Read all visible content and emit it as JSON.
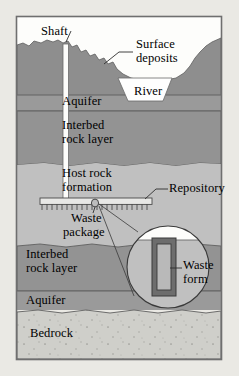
{
  "figure": {
    "frame": {
      "x": 16,
      "y": 16,
      "width": 206,
      "height": 344
    }
  },
  "palette": {
    "page_background": "#eae9e4",
    "sky": "#fdfdfb",
    "surface_deposits": "#8e8e8e",
    "aquifer": "#9a9a9a",
    "interbed_rock": "#939393",
    "host_rock": "#c0c0c0",
    "bedrock": "#cfcfca",
    "river_water": "#fefefe",
    "waste_package": "#6d6d6d",
    "waste_form": "#b9b9b9",
    "frame_stroke": "#6f6f6f",
    "line": "#3a3a3a",
    "text": "#000000"
  },
  "labels": {
    "shaft": "Shaft",
    "surface_deposits_line1": "Surface",
    "surface_deposits_line2": "deposits",
    "river": "River",
    "aquifer_upper": "Aquifer",
    "interbed_upper_line1": "Interbed",
    "interbed_upper_line2": "rock layer",
    "host_rock_line1": "Host rock",
    "host_rock_line2": "formation",
    "repository": "Repository",
    "waste_package_line1": "Waste",
    "waste_package_line2": "package",
    "interbed_lower_line1": "Interbed",
    "interbed_lower_line2": "rock layer",
    "waste_form_line1": "Waste",
    "waste_form_line2": "form",
    "aquifer_lower": "Aquifer",
    "bedrock": "Bedrock"
  },
  "diagram_elements": {
    "layers": [
      {
        "name": "sky-air",
        "label": ""
      },
      {
        "name": "surface-deposits",
        "label": "Surface deposits"
      },
      {
        "name": "aquifer-upper",
        "label": "Aquifer"
      },
      {
        "name": "interbed-rock-upper",
        "label": "Interbed rock layer"
      },
      {
        "name": "host-rock-formation",
        "label": "Host rock formation"
      },
      {
        "name": "interbed-rock-lower",
        "label": "Interbed rock layer"
      },
      {
        "name": "aquifer-lower",
        "label": "Aquifer"
      },
      {
        "name": "bedrock",
        "label": "Bedrock"
      }
    ],
    "features": [
      {
        "name": "shaft",
        "label": "Shaft"
      },
      {
        "name": "river",
        "label": "River"
      },
      {
        "name": "repository",
        "label": "Repository"
      },
      {
        "name": "waste-package",
        "label": "Waste package"
      },
      {
        "name": "waste-form",
        "label": "Waste form"
      },
      {
        "name": "magnifier-inset",
        "label": ""
      }
    ]
  }
}
